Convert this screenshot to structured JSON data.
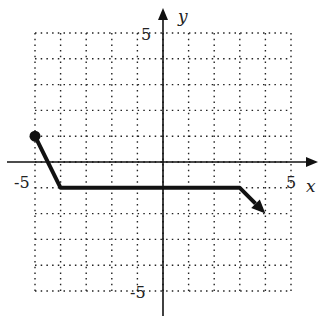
{
  "chart_data": {
    "type": "line",
    "title": "",
    "xlabel": "x",
    "ylabel": "y",
    "xlim": [
      -5,
      5
    ],
    "ylim": [
      -5,
      5
    ],
    "grid": true,
    "grid_style": "dotted",
    "tick_labels": {
      "x": [
        "-5",
        "5"
      ],
      "y": [
        "5",
        "-5"
      ]
    },
    "series": [
      {
        "name": "piecewise function",
        "points": [
          [
            -5,
            1
          ],
          [
            -4,
            -1
          ],
          [
            3,
            -1
          ],
          [
            4,
            -2
          ]
        ],
        "start_marker": "closed-dot",
        "end_marker": "arrow"
      }
    ],
    "annotations": []
  },
  "labels": {
    "x_axis": "x",
    "y_axis": "y",
    "x_min": "-5",
    "x_max": "5",
    "y_max": "5",
    "y_min": "-5"
  }
}
